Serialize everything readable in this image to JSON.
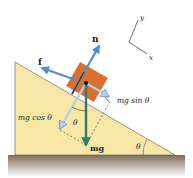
{
  "diagram": {
    "labels": {
      "normal": "n",
      "friction": "f",
      "parallel": "mg sin θ",
      "perpendicular": "mg cos θ",
      "weight": "mg",
      "angle_inner": "θ",
      "angle_incline": "θ",
      "axis_x": "x",
      "axis_y": "y"
    },
    "colors": {
      "incline": "#f7e7a6",
      "block": "#d9702e",
      "ground": "#8c7a6b",
      "force_arrow": "#4a90d9",
      "weight_arrow": "#2e7d6b",
      "component_arrow": "#b8cde6"
    }
  }
}
